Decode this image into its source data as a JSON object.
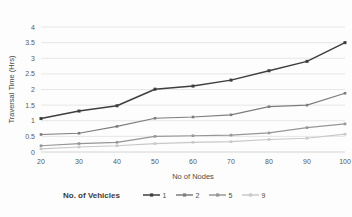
{
  "chart_data": {
    "type": "line",
    "title": "",
    "xlabel": "No of Nodes",
    "ylabel": "Traversal Time (Hrs)",
    "categories": [
      20,
      30,
      40,
      50,
      60,
      70,
      80,
      90,
      100
    ],
    "x": [
      20,
      30,
      40,
      50,
      60,
      70,
      80,
      90,
      100
    ],
    "xlim": [
      20,
      100
    ],
    "ylim": [
      0,
      4
    ],
    "ytick_labels": [
      "0",
      "0.5",
      "1",
      "1.5",
      "2",
      "2.5",
      "3",
      "3.5",
      "4"
    ],
    "ytick_values": [
      0,
      0.5,
      1,
      1.5,
      2,
      2.5,
      3,
      3.5,
      4
    ],
    "xtick_labels": [
      "20",
      "30",
      "40",
      "50",
      "60",
      "70",
      "80",
      "90",
      "100"
    ],
    "grid": "horizontal",
    "legend_position": "bottom",
    "legend_title": "No. of Vehicles",
    "marker": "square",
    "series": [
      {
        "name": "1",
        "color": "#3f3f3f",
        "values": [
          1.07,
          1.31,
          1.48,
          2.01,
          2.11,
          2.3,
          2.6,
          2.9,
          3.5
        ]
      },
      {
        "name": "2",
        "color": "#7d7d7d",
        "values": [
          0.56,
          0.6,
          0.82,
          1.08,
          1.12,
          1.19,
          1.45,
          1.5,
          1.88
        ]
      },
      {
        "name": "5",
        "color": "#969696",
        "values": [
          0.2,
          0.27,
          0.31,
          0.5,
          0.52,
          0.54,
          0.61,
          0.78,
          0.9
        ]
      },
      {
        "name": "9",
        "color": "#c8c8c8",
        "values": [
          0.1,
          0.16,
          0.2,
          0.27,
          0.31,
          0.33,
          0.4,
          0.44,
          0.57
        ]
      }
    ]
  }
}
